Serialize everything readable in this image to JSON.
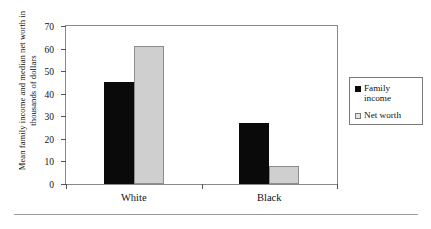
{
  "chart_data": {
    "type": "bar",
    "title": "",
    "xlabel": "",
    "ylabel": "Mean family income and median net worth in thousands of dollars",
    "categories": [
      "White",
      "Black"
    ],
    "series": [
      {
        "name": "Family income",
        "color": "#0a0a0a",
        "values": [
          45,
          27
        ]
      },
      {
        "name": "Net worth",
        "color": "#cfcfcf",
        "values": [
          61,
          8
        ]
      }
    ],
    "ylim": [
      0,
      70
    ],
    "yticks": [
      0,
      10,
      20,
      30,
      40,
      50,
      60,
      70
    ],
    "ytick_labels": [
      "0",
      "10",
      "20",
      "30",
      "40",
      "50",
      "60",
      "70"
    ],
    "grid": false,
    "legend_position": "right"
  },
  "legend": {
    "items": [
      {
        "label": "Family income"
      },
      {
        "label": "Net worth"
      }
    ]
  }
}
